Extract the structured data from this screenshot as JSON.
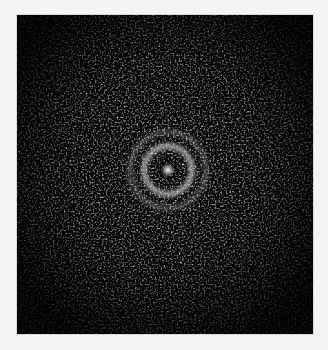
{
  "image": {
    "description": "Grayscale noisy diffraction-like pattern with bright central spot and concentric ring",
    "background_color": "#f4f4f4",
    "frame_color": "#050505",
    "center": {
      "x": 151,
      "y": 155
    },
    "central_spot_radius": 6,
    "inner_ring_radius": 24,
    "outer_ring_radius": 38
  }
}
